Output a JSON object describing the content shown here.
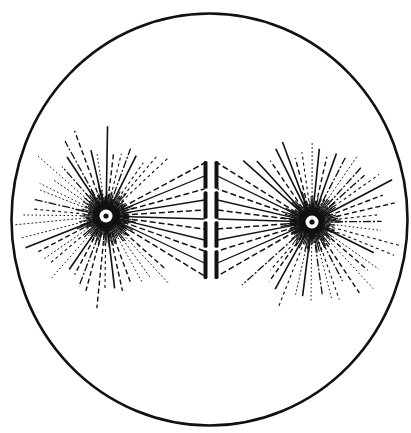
{
  "diagram": {
    "type": "cell-division-spindle",
    "colors": {
      "ink": "#111111",
      "background": "#ffffff"
    },
    "cell": {
      "cx": 209.5,
      "cy": 219.5,
      "rx": 198,
      "ry": 206,
      "stroke_width": 2.6
    },
    "centrosomes": [
      {
        "id": "left",
        "cx": 106,
        "cy": 216,
        "ring_r": 6.5,
        "dot_r": 2.6,
        "halo_r": 13
      },
      {
        "id": "right",
        "cx": 312,
        "cy": 222,
        "ring_r": 6.5,
        "dot_r": 2.6,
        "halo_r": 12
      }
    ],
    "asters": [
      {
        "centrosome": "left",
        "ray_count": 52,
        "inner_r": 9,
        "min_len": 62,
        "max_len": 95,
        "exclude_from_deg": -38,
        "exclude_to_deg": 38
      },
      {
        "centrosome": "right",
        "ray_count": 52,
        "inner_r": 9,
        "min_len": 62,
        "max_len": 95,
        "exclude_from_deg": 142,
        "exclude_to_deg": 218
      }
    ],
    "metaphase_plates": [
      {
        "id": "left-plate",
        "x": 205.5,
        "y_top": 161,
        "y_bottom": 279,
        "gaps": [
          190,
          220,
          249
        ]
      },
      {
        "id": "right-plate",
        "x": 216.5,
        "y_top": 161,
        "y_bottom": 279,
        "gaps": [
          190,
          220,
          249
        ]
      }
    ],
    "spindle_fibers": {
      "attach_y": [
        163,
        176,
        189,
        200,
        210,
        219,
        229,
        240,
        251,
        263,
        276
      ]
    }
  }
}
